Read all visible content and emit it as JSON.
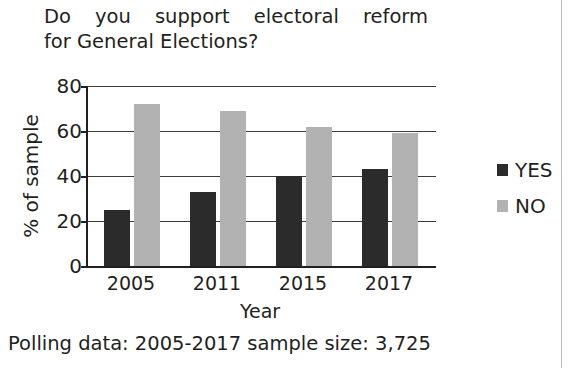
{
  "title": {
    "line1": "Do you support electoral reform",
    "line2": "for General Elections?"
  },
  "caption": "Polling data: 2005-2017 sample size: 3,725",
  "legend": {
    "position": "right",
    "items": [
      {
        "label": "YES",
        "color": "#2b2b2b",
        "swatch_name": "legend-swatch-yes"
      },
      {
        "label": "NO",
        "color": "#b2b2b2",
        "swatch_name": "legend-swatch-no"
      }
    ]
  },
  "axes": {
    "ylabel": "% of sample",
    "xlabel": "Year",
    "yticks": [
      "80",
      "60",
      "40",
      "20",
      "0"
    ],
    "ylim": [
      0,
      80
    ],
    "xticks": [
      "2005",
      "2011",
      "2015",
      "2017"
    ]
  },
  "chart_data": {
    "type": "bar",
    "title": "Do you support electoral reform for General Elections?",
    "categories": [
      "2005",
      "2011",
      "2015",
      "2017"
    ],
    "series": [
      {
        "name": "YES",
        "color": "#2b2b2b",
        "values": [
          25,
          33,
          40,
          43
        ]
      },
      {
        "name": "NO",
        "color": "#b2b2b2",
        "values": [
          72,
          69,
          62,
          59
        ]
      }
    ],
    "xlabel": "Year",
    "ylabel": "% of sample",
    "ylim": [
      0,
      80
    ],
    "ytick_interval": 20,
    "grid": true,
    "grid_axis": "y",
    "legend": "right",
    "annotation": "Polling data: 2005-2017 sample size: 3,725"
  }
}
